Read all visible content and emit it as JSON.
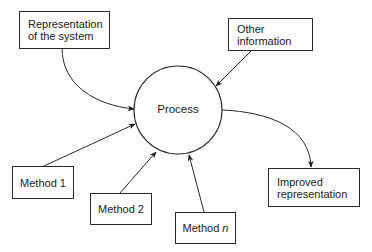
{
  "diagram": {
    "process": {
      "label": "Process"
    },
    "inputs": [
      {
        "id": "representation",
        "label": "Representation\nof the system"
      },
      {
        "id": "other",
        "label": "Other\ninformation"
      },
      {
        "id": "method1",
        "label": "Method 1"
      },
      {
        "id": "method2",
        "label": "Method 2"
      },
      {
        "id": "methodn",
        "label_prefix": "Method ",
        "label_var": "n"
      }
    ],
    "output": {
      "id": "improved",
      "label": "Improved\nrepresentation"
    }
  }
}
